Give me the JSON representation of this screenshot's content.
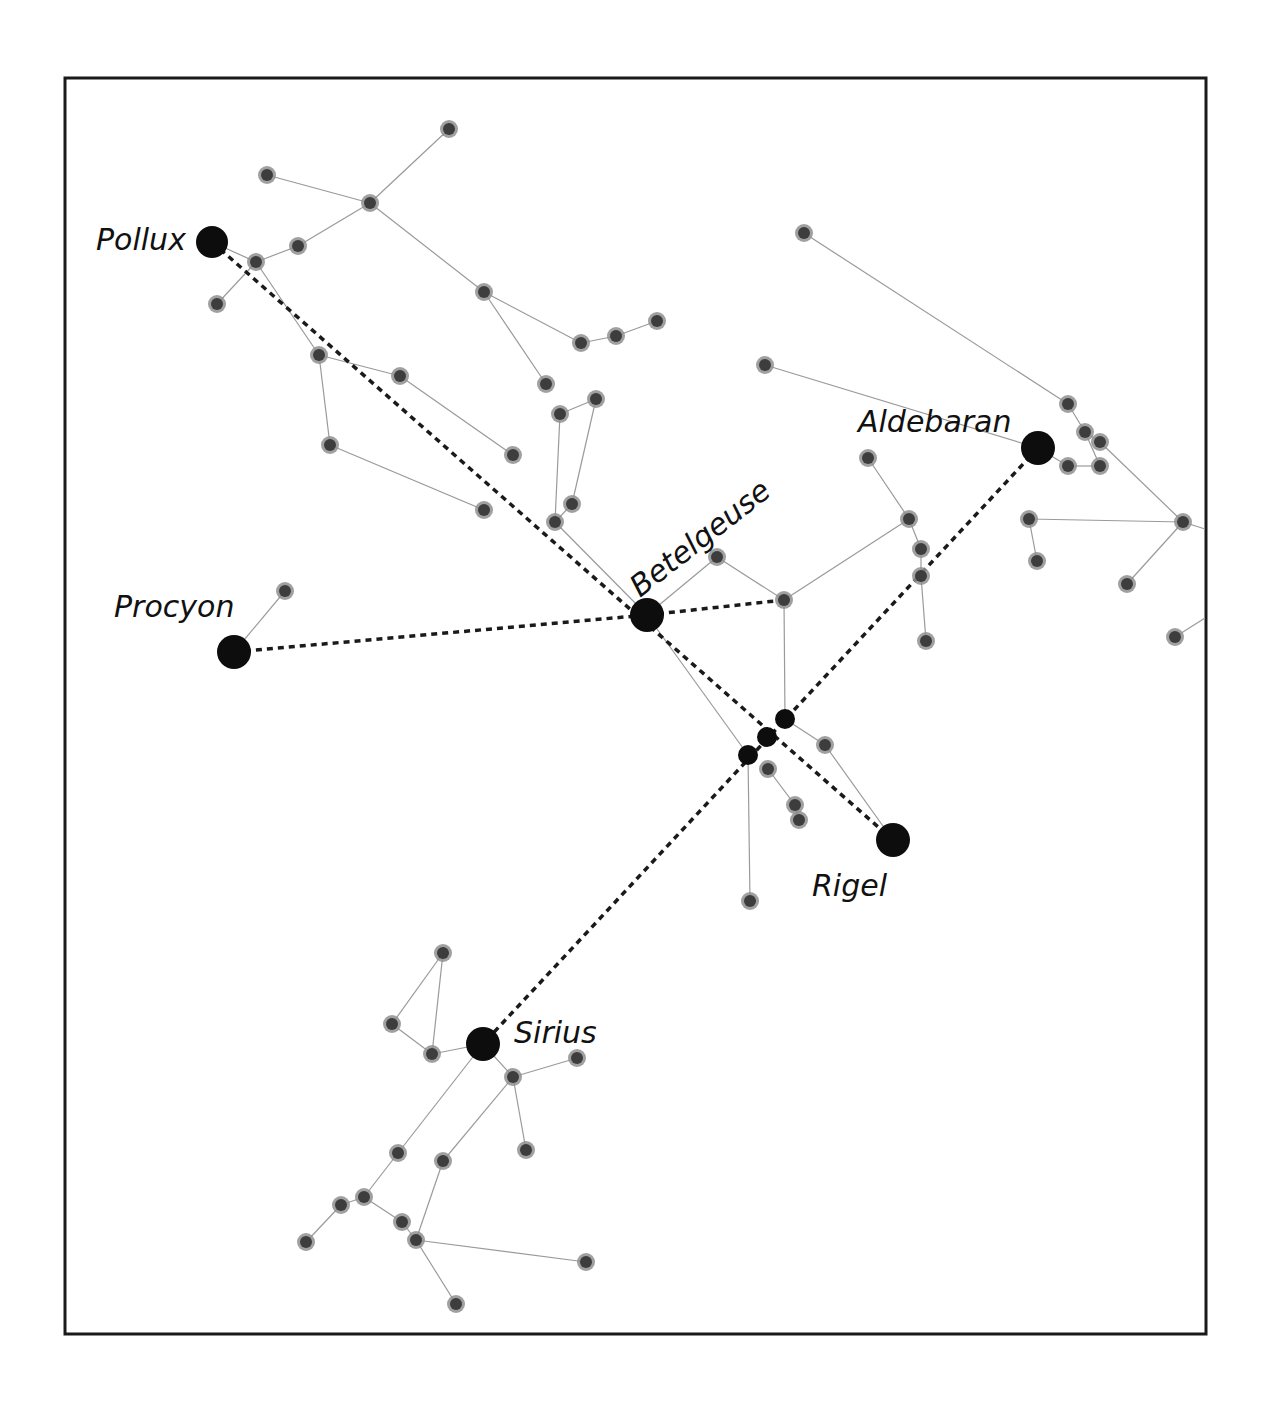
{
  "figure": {
    "frame": {
      "x": 65,
      "y": 78,
      "width": 1141,
      "height": 1256
    },
    "colors": {
      "frame": "#1a1a1a",
      "constellation_line": "#9a9a9a",
      "dashed_line": "#1a1a1a",
      "star_halo": "#8f8f8f",
      "star_core": "#3d3d3d",
      "bright_star": "#0d0d0d",
      "label": "#111111"
    },
    "bright_stars": [
      {
        "name": "Pollux",
        "x": 212,
        "y": 242,
        "r": 16,
        "label": {
          "text": "Pollux",
          "x": 96,
          "y": 250,
          "rotate": 0
        }
      },
      {
        "name": "Procyon",
        "x": 234,
        "y": 652,
        "r": 17,
        "label": {
          "text": "Procyon",
          "x": 114,
          "y": 617,
          "rotate": 0
        }
      },
      {
        "name": "Betelgeuse",
        "x": 647,
        "y": 615,
        "r": 17,
        "label": {
          "text": "Betelgeuse",
          "x": 640,
          "y": 598,
          "rotate": -38
        }
      },
      {
        "name": "Aldebaran",
        "x": 1038,
        "y": 448,
        "r": 17,
        "label": {
          "text": "Aldebaran",
          "x": 858,
          "y": 432,
          "rotate": 0
        }
      },
      {
        "name": "Rigel",
        "x": 893,
        "y": 840,
        "r": 17,
        "label": {
          "text": "Rigel",
          "x": 812,
          "y": 896,
          "rotate": 0
        }
      },
      {
        "name": "Sirius",
        "x": 483,
        "y": 1044,
        "r": 17,
        "label": {
          "text": "Sirius",
          "x": 514,
          "y": 1043,
          "rotate": 0
        }
      }
    ],
    "belt_stars": [
      {
        "x": 785,
        "y": 719,
        "r": 10
      },
      {
        "x": 767,
        "y": 737,
        "r": 10
      },
      {
        "x": 748,
        "y": 755,
        "r": 10
      }
    ],
    "stars": [
      {
        "x": 449,
        "y": 129
      },
      {
        "x": 267,
        "y": 175
      },
      {
        "x": 370,
        "y": 203
      },
      {
        "x": 298,
        "y": 246
      },
      {
        "x": 256,
        "y": 262
      },
      {
        "x": 217,
        "y": 304
      },
      {
        "x": 484,
        "y": 292
      },
      {
        "x": 581,
        "y": 343
      },
      {
        "x": 616,
        "y": 336
      },
      {
        "x": 657,
        "y": 321
      },
      {
        "x": 319,
        "y": 355
      },
      {
        "x": 400,
        "y": 376
      },
      {
        "x": 546,
        "y": 384
      },
      {
        "x": 560,
        "y": 414
      },
      {
        "x": 596,
        "y": 399
      },
      {
        "x": 330,
        "y": 445
      },
      {
        "x": 513,
        "y": 455
      },
      {
        "x": 484,
        "y": 510
      },
      {
        "x": 572,
        "y": 504
      },
      {
        "x": 555,
        "y": 522
      },
      {
        "x": 285,
        "y": 591
      },
      {
        "x": 717,
        "y": 557
      },
      {
        "x": 784,
        "y": 600
      },
      {
        "x": 804,
        "y": 233
      },
      {
        "x": 765,
        "y": 365
      },
      {
        "x": 868,
        "y": 458
      },
      {
        "x": 909,
        "y": 519
      },
      {
        "x": 921,
        "y": 549
      },
      {
        "x": 921,
        "y": 576
      },
      {
        "x": 926,
        "y": 641
      },
      {
        "x": 1068,
        "y": 404
      },
      {
        "x": 1085,
        "y": 432
      },
      {
        "x": 1100,
        "y": 442
      },
      {
        "x": 1068,
        "y": 466
      },
      {
        "x": 1100,
        "y": 466
      },
      {
        "x": 1029,
        "y": 519
      },
      {
        "x": 1037,
        "y": 561
      },
      {
        "x": 1183,
        "y": 522
      },
      {
        "x": 1127,
        "y": 584
      },
      {
        "x": 1175,
        "y": 637
      },
      {
        "x": 825,
        "y": 745
      },
      {
        "x": 768,
        "y": 769
      },
      {
        "x": 795,
        "y": 805
      },
      {
        "x": 799,
        "y": 820
      },
      {
        "x": 750,
        "y": 901
      },
      {
        "x": 443,
        "y": 953
      },
      {
        "x": 392,
        "y": 1024
      },
      {
        "x": 432,
        "y": 1054
      },
      {
        "x": 513,
        "y": 1077
      },
      {
        "x": 577,
        "y": 1058
      },
      {
        "x": 526,
        "y": 1150
      },
      {
        "x": 398,
        "y": 1153
      },
      {
        "x": 443,
        "y": 1161
      },
      {
        "x": 364,
        "y": 1197
      },
      {
        "x": 341,
        "y": 1205
      },
      {
        "x": 402,
        "y": 1222
      },
      {
        "x": 416,
        "y": 1240
      },
      {
        "x": 306,
        "y": 1242
      },
      {
        "x": 586,
        "y": 1262
      },
      {
        "x": 456,
        "y": 1304
      }
    ],
    "constellation_lines": [
      [
        449,
        129,
        370,
        203
      ],
      [
        267,
        175,
        370,
        203
      ],
      [
        370,
        203,
        298,
        246
      ],
      [
        298,
        246,
        256,
        262
      ],
      [
        212,
        242,
        256,
        262
      ],
      [
        256,
        262,
        217,
        304
      ],
      [
        370,
        203,
        484,
        292
      ],
      [
        484,
        292,
        581,
        343
      ],
      [
        581,
        343,
        616,
        336
      ],
      [
        616,
        336,
        657,
        321
      ],
      [
        484,
        292,
        546,
        384
      ],
      [
        256,
        262,
        319,
        355
      ],
      [
        319,
        355,
        400,
        376
      ],
      [
        400,
        376,
        513,
        455
      ],
      [
        319,
        355,
        330,
        445
      ],
      [
        330,
        445,
        484,
        510
      ],
      [
        560,
        414,
        596,
        399
      ],
      [
        560,
        414,
        555,
        522
      ],
      [
        596,
        399,
        572,
        504
      ],
      [
        572,
        504,
        555,
        522
      ],
      [
        555,
        522,
        647,
        615
      ],
      [
        234,
        652,
        285,
        591
      ],
      [
        647,
        615,
        717,
        557
      ],
      [
        717,
        557,
        784,
        600
      ],
      [
        784,
        600,
        909,
        519
      ],
      [
        868,
        458,
        909,
        519
      ],
      [
        909,
        519,
        921,
        549
      ],
      [
        921,
        549,
        921,
        576
      ],
      [
        921,
        576,
        926,
        641
      ],
      [
        784,
        600,
        785,
        719
      ],
      [
        647,
        615,
        748,
        755
      ],
      [
        748,
        755,
        750,
        901
      ],
      [
        785,
        719,
        825,
        745
      ],
      [
        825,
        745,
        893,
        840
      ],
      [
        768,
        769,
        795,
        805
      ],
      [
        795,
        805,
        799,
        820
      ],
      [
        804,
        233,
        1068,
        404
      ],
      [
        765,
        365,
        1038,
        448
      ],
      [
        1068,
        404,
        1085,
        432
      ],
      [
        1085,
        432,
        1100,
        466
      ],
      [
        1068,
        466,
        1100,
        466
      ],
      [
        1038,
        448,
        1068,
        466
      ],
      [
        1085,
        432,
        1100,
        442
      ],
      [
        1100,
        442,
        1183,
        522
      ],
      [
        1029,
        519,
        1183,
        522
      ],
      [
        1029,
        519,
        1037,
        561
      ],
      [
        1183,
        522,
        1127,
        584
      ],
      [
        1183,
        522,
        1205,
        529
      ],
      [
        1175,
        637,
        1205,
        618
      ],
      [
        443,
        953,
        392,
        1024
      ],
      [
        443,
        953,
        432,
        1054
      ],
      [
        392,
        1024,
        432,
        1054
      ],
      [
        432,
        1054,
        483,
        1044
      ],
      [
        483,
        1044,
        513,
        1077
      ],
      [
        513,
        1077,
        577,
        1058
      ],
      [
        513,
        1077,
        526,
        1150
      ],
      [
        513,
        1077,
        443,
        1161
      ],
      [
        483,
        1044,
        398,
        1153
      ],
      [
        398,
        1153,
        364,
        1197
      ],
      [
        364,
        1197,
        341,
        1205
      ],
      [
        341,
        1205,
        306,
        1242
      ],
      [
        364,
        1197,
        402,
        1222
      ],
      [
        402,
        1222,
        416,
        1240
      ],
      [
        443,
        1161,
        416,
        1240
      ],
      [
        416,
        1240,
        586,
        1262
      ],
      [
        416,
        1240,
        456,
        1304
      ]
    ],
    "dashed_lines": [
      {
        "from": "Pollux",
        "to": "Rigel",
        "coords": [
          212,
          242,
          893,
          840
        ]
      },
      {
        "from": "Procyon",
        "to": "Betelgeuse",
        "coords": [
          234,
          652,
          647,
          615
        ]
      },
      {
        "from": "Betelgeuse",
        "to": "Meissa-branch",
        "coords": [
          647,
          615,
          784,
          600
        ]
      },
      {
        "from": "Aldebaran",
        "to": "Sirius",
        "coords": [
          1038,
          448,
          483,
          1044
        ]
      }
    ]
  }
}
